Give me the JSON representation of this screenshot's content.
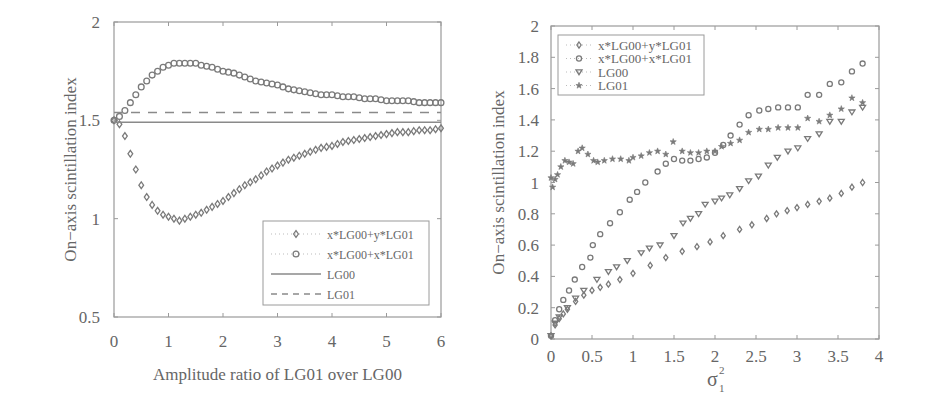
{
  "chart_data": [
    {
      "type": "line",
      "title": "",
      "xlabel": "Amplitude ratio of LG01 over LG00",
      "ylabel": "On−axis scintillation index",
      "xlim": [
        0,
        6
      ],
      "ylim": [
        0.5,
        2
      ],
      "xticks": [
        "0",
        "1",
        "2",
        "3",
        "4",
        "5",
        "6"
      ],
      "yticks": [
        "0.5",
        "1",
        "1.5",
        "2"
      ],
      "grid": false,
      "legend_position": "lower right",
      "series": [
        {
          "name": "x*LG00+y*LG01",
          "marker": "diamond",
          "line": "dotted",
          "x": [
            0,
            0.1,
            0.2,
            0.3,
            0.4,
            0.5,
            0.6,
            0.7,
            0.8,
            0.9,
            1.0,
            1.1,
            1.2,
            1.3,
            1.4,
            1.5,
            1.6,
            1.8,
            2.0,
            2.2,
            2.4,
            2.6,
            2.8,
            3.0,
            3.2,
            3.4,
            3.6,
            3.8,
            4.0,
            4.2,
            4.4,
            4.6,
            4.8,
            5.0,
            5.2,
            5.4,
            5.6,
            5.8,
            6.0
          ],
          "y": [
            1.5,
            1.48,
            1.42,
            1.33,
            1.25,
            1.17,
            1.11,
            1.07,
            1.04,
            1.02,
            1.01,
            1.0,
            0.99,
            1.0,
            1.01,
            1.02,
            1.03,
            1.06,
            1.09,
            1.13,
            1.17,
            1.2,
            1.24,
            1.27,
            1.3,
            1.32,
            1.34,
            1.36,
            1.37,
            1.39,
            1.4,
            1.41,
            1.42,
            1.43,
            1.44,
            1.44,
            1.45,
            1.45,
            1.46
          ]
        },
        {
          "name": "x*LG00+x*LG01",
          "marker": "circle",
          "line": "dotted",
          "x": [
            0,
            0.1,
            0.2,
            0.3,
            0.4,
            0.5,
            0.6,
            0.7,
            0.8,
            0.9,
            1.0,
            1.1,
            1.2,
            1.3,
            1.4,
            1.5,
            1.6,
            1.8,
            2.0,
            2.2,
            2.4,
            2.6,
            2.8,
            3.0,
            3.2,
            3.4,
            3.6,
            3.8,
            4.0,
            4.2,
            4.4,
            4.6,
            4.8,
            5.0,
            5.2,
            5.4,
            5.6,
            5.8,
            6.0
          ],
          "y": [
            1.5,
            1.52,
            1.55,
            1.59,
            1.63,
            1.67,
            1.7,
            1.73,
            1.75,
            1.77,
            1.78,
            1.79,
            1.79,
            1.79,
            1.79,
            1.79,
            1.78,
            1.77,
            1.75,
            1.74,
            1.72,
            1.7,
            1.69,
            1.68,
            1.66,
            1.65,
            1.64,
            1.63,
            1.63,
            1.62,
            1.62,
            1.61,
            1.61,
            1.6,
            1.6,
            1.6,
            1.59,
            1.59,
            1.59
          ]
        },
        {
          "name": "LG00",
          "marker": "none",
          "line": "solid",
          "x": [
            0,
            6
          ],
          "y": [
            1.49,
            1.49
          ]
        },
        {
          "name": "LG01",
          "marker": "none",
          "line": "dashed",
          "x": [
            0,
            6
          ],
          "y": [
            1.54,
            1.54
          ]
        }
      ]
    },
    {
      "type": "scatter",
      "title": "",
      "xlabel": "σ₁²",
      "xlabel_base": "σ",
      "xlabel_sup": "2",
      "xlabel_sub": "1",
      "ylabel": "On−axis scintillation index",
      "xlim": [
        0,
        4
      ],
      "ylim": [
        0,
        2
      ],
      "xticks": [
        "0",
        "0.5",
        "1",
        "1.5",
        "2",
        "2.5",
        "3",
        "3.5",
        "4"
      ],
      "yticks": [
        "0",
        "0.2",
        "0.4",
        "0.6",
        "0.8",
        "1",
        "1.2",
        "1.4",
        "1.6",
        "1.8",
        "2"
      ],
      "grid": false,
      "legend_position": "upper left",
      "series": [
        {
          "name": "x*LG00+y*LG01",
          "marker": "diamond",
          "x": [
            0,
            0.05,
            0.1,
            0.15,
            0.2,
            0.3,
            0.4,
            0.5,
            0.6,
            0.7,
            0.84,
            1.0,
            1.21,
            1.4,
            1.6,
            1.78,
            1.94,
            2.1,
            2.3,
            2.45,
            2.63,
            2.75,
            2.88,
            3.0,
            3.13,
            3.27,
            3.4,
            3.54,
            3.67,
            3.8
          ],
          "y": [
            0.02,
            0.09,
            0.13,
            0.16,
            0.19,
            0.24,
            0.28,
            0.31,
            0.33,
            0.35,
            0.38,
            0.42,
            0.47,
            0.52,
            0.56,
            0.59,
            0.62,
            0.66,
            0.7,
            0.73,
            0.77,
            0.8,
            0.82,
            0.84,
            0.86,
            0.88,
            0.9,
            0.93,
            0.97,
            1.0
          ]
        },
        {
          "name": "x*LG00+x*LG01",
          "marker": "circle",
          "x": [
            0,
            0.05,
            0.1,
            0.15,
            0.22,
            0.29,
            0.38,
            0.48,
            0.51,
            0.6,
            0.72,
            0.84,
            0.96,
            1.05,
            1.15,
            1.3,
            1.4,
            1.5,
            1.6,
            1.7,
            1.8,
            1.9,
            2.0,
            2.1,
            2.19,
            2.3,
            2.41,
            2.54,
            2.65,
            2.77,
            2.89,
            3.01,
            3.13,
            3.27,
            3.4,
            3.54,
            3.67,
            3.8
          ],
          "y": [
            0.02,
            0.12,
            0.19,
            0.25,
            0.31,
            0.38,
            0.46,
            0.52,
            0.6,
            0.67,
            0.74,
            0.81,
            0.89,
            0.94,
            1.0,
            1.07,
            1.12,
            1.15,
            1.14,
            1.14,
            1.15,
            1.16,
            1.19,
            1.24,
            1.3,
            1.37,
            1.43,
            1.46,
            1.47,
            1.48,
            1.48,
            1.48,
            1.56,
            1.56,
            1.63,
            1.64,
            1.71,
            1.76
          ]
        },
        {
          "name": "LG00",
          "marker": "triangle-down",
          "x": [
            0,
            0.05,
            0.1,
            0.2,
            0.3,
            0.4,
            0.56,
            0.7,
            0.8,
            0.93,
            1.1,
            1.2,
            1.33,
            1.5,
            1.61,
            1.7,
            1.8,
            1.88,
            2.0,
            2.08,
            2.18,
            2.3,
            2.41,
            2.53,
            2.65,
            2.76,
            2.89,
            3.01,
            3.13,
            3.27,
            3.4,
            3.54,
            3.67,
            3.8
          ],
          "y": [
            0.02,
            0.1,
            0.14,
            0.2,
            0.26,
            0.31,
            0.38,
            0.43,
            0.46,
            0.5,
            0.55,
            0.58,
            0.6,
            0.66,
            0.74,
            0.77,
            0.8,
            0.86,
            0.88,
            0.9,
            0.92,
            0.96,
            1.01,
            1.04,
            1.11,
            1.16,
            1.2,
            1.22,
            1.28,
            1.31,
            1.39,
            1.39,
            1.45,
            1.48
          ]
        },
        {
          "name": "LG01",
          "marker": "star",
          "x": [
            0,
            0.02,
            0.05,
            0.08,
            0.12,
            0.17,
            0.22,
            0.27,
            0.33,
            0.38,
            0.45,
            0.52,
            0.57,
            0.65,
            0.75,
            0.85,
            0.95,
            1.0,
            1.1,
            1.2,
            1.3,
            1.4,
            1.49,
            1.6,
            1.7,
            1.8,
            1.9,
            2.0,
            2.08,
            2.19,
            2.3,
            2.41,
            2.54,
            2.65,
            2.77,
            2.89,
            3.01,
            3.13,
            3.27,
            3.4,
            3.54,
            3.67,
            3.8
          ],
          "y": [
            1.03,
            0.97,
            1.02,
            1.05,
            1.1,
            1.14,
            1.13,
            1.12,
            1.2,
            1.22,
            1.18,
            1.14,
            1.13,
            1.14,
            1.15,
            1.15,
            1.14,
            1.16,
            1.17,
            1.19,
            1.2,
            1.18,
            1.26,
            1.2,
            1.19,
            1.19,
            1.2,
            1.2,
            1.23,
            1.25,
            1.27,
            1.32,
            1.34,
            1.34,
            1.35,
            1.35,
            1.35,
            1.41,
            1.39,
            1.43,
            1.47,
            1.54,
            1.51
          ]
        }
      ]
    }
  ],
  "left_chart": {
    "xlabel": "Amplitude ratio of LG01 over LG00",
    "ylabel": "On−axis scintillation index",
    "legend": [
      "x*LG00+y*LG01",
      "x*LG00+x*LG01",
      "LG00",
      "LG01"
    ]
  },
  "right_chart": {
    "ylabel": "On−axis scintillation index",
    "legend": [
      "x*LG00+y*LG01",
      "x*LG00+x*LG01",
      "LG00",
      "LG01"
    ]
  },
  "colors": {
    "axis": "#9a9a9a",
    "marker": "#7a7a7a",
    "line": "#8a8a8a",
    "text": "#666666"
  }
}
